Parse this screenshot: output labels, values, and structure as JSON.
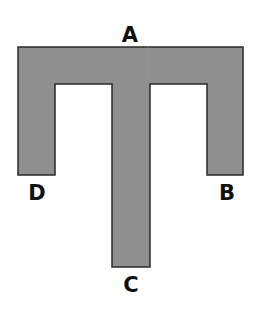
{
  "diagram": {
    "shape": "T-shaped piece with two downward side legs",
    "fill_color": "#8f8f8f",
    "stroke_color": "#2a2a2a",
    "labels": [
      {
        "id": "A",
        "text": "A",
        "position": "top-center"
      },
      {
        "id": "B",
        "text": "B",
        "position": "right-leg-bottom"
      },
      {
        "id": "C",
        "text": "C",
        "position": "stem-bottom"
      },
      {
        "id": "D",
        "text": "D",
        "position": "left-leg-bottom"
      }
    ]
  }
}
